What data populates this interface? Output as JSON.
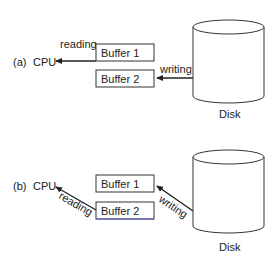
{
  "panels": [
    {
      "id": "a",
      "tag": "(a)",
      "cpu_label": "CPU",
      "buffers": [
        "Buffer 1",
        "Buffer 2"
      ],
      "read_label": "reading",
      "write_label": "writing",
      "disk_label": "Disk",
      "read_from": "Buffer 1",
      "write_to": "Buffer 2"
    },
    {
      "id": "b",
      "tag": "(b)",
      "cpu_label": "CPU",
      "buffers": [
        "Buffer 1",
        "Buffer 2"
      ],
      "read_label": "reading",
      "write_label": "writing",
      "disk_label": "Disk",
      "read_from": "Buffer 2",
      "write_to": "Buffer 1"
    }
  ],
  "colors": {
    "stroke": "#222222",
    "buffer2_b_underline": "#5a5ad0"
  }
}
